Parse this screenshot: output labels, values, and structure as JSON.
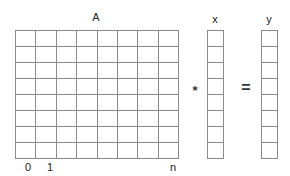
{
  "diagram": {
    "matrix": {
      "label": "A",
      "rows": 8,
      "cols": 8
    },
    "vector_x": {
      "label": "x",
      "rows": 8
    },
    "vector_y": {
      "label": "y",
      "rows": 8
    },
    "operators": {
      "multiply": "*",
      "equals": "="
    },
    "column_indices": {
      "first": "0",
      "second": "1",
      "last": "n"
    },
    "colors": {
      "grid_line": "#8a8a8a",
      "text": "#222222",
      "background": "#ffffff"
    }
  }
}
